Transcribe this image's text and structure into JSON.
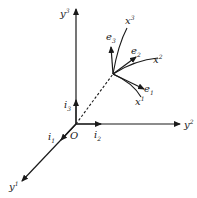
{
  "figure": {
    "origin_label": "O",
    "axes": [
      {
        "name": "y",
        "index": "1"
      },
      {
        "name": "y",
        "index": "2"
      },
      {
        "name": "y",
        "index": "3"
      }
    ],
    "cartesian_basis": [
      {
        "name": "i",
        "index": "1"
      },
      {
        "name": "i",
        "index": "2"
      },
      {
        "name": "i",
        "index": "3"
      }
    ],
    "curvilinear_lines": [
      {
        "name": "x",
        "index": "1"
      },
      {
        "name": "x",
        "index": "2"
      },
      {
        "name": "x",
        "index": "3"
      }
    ],
    "local_basis": [
      {
        "name": "e",
        "index": "1"
      },
      {
        "name": "e",
        "index": "2"
      },
      {
        "name": "e",
        "index": "3"
      }
    ],
    "colors": {
      "ink": "#1a1a1a",
      "background": "#ffffff"
    }
  }
}
